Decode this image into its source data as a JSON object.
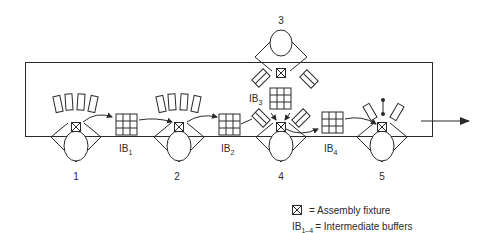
{
  "diagram": {
    "stations": [
      {
        "label": "1"
      },
      {
        "label": "2"
      },
      {
        "label": "3"
      },
      {
        "label": "4"
      },
      {
        "label": "5"
      }
    ],
    "buffers": [
      {
        "label": "IB",
        "sub": "1"
      },
      {
        "label": "IB",
        "sub": "2"
      },
      {
        "label": "IB",
        "sub": "3"
      },
      {
        "label": "IB",
        "sub": "4"
      }
    ],
    "legend": {
      "fixture_text": "= Assembly fixture",
      "buffers_prefix": "IB",
      "buffers_sub": "1–4",
      "buffers_text": "= Intermediate buffers"
    }
  }
}
